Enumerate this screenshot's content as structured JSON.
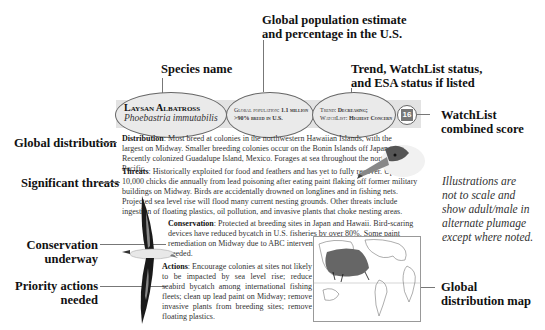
{
  "callouts": {
    "species_name": "Species name",
    "global_population_line1": "Global population estimate",
    "global_population_line2": "and percentage in the U.S.",
    "trend_line1": "Trend, WatchList status,",
    "trend_line2": "and ESA status if listed",
    "watchlist_score_line1": "WatchList",
    "watchlist_score_line2": "combined score",
    "global_distribution": "Global distribution",
    "significant_threats": "Significant threats",
    "conservation_line1": "Conservation",
    "conservation_line2": "underway",
    "priority_line1": "Priority actions",
    "priority_line2": "needed",
    "map_line1": "Global",
    "map_line2": "distribution map"
  },
  "header": {
    "common_name": "Laysan Albatross",
    "scientific_name": "Phoebastria immutabilis",
    "population_label": "Global population:",
    "population_value": "1.1 million",
    "us_percent": ">90% breed in U.S.",
    "trend_label": "Trend:",
    "trend_value": "Decreasing;",
    "watchlist_label": "WatchList:",
    "watchlist_value": "Highest Concern",
    "score": "16"
  },
  "sections": {
    "distribution_label": "Distribution",
    "distribution_text": ": Most breed at colonies in the northwestern Hawaiian Islands, with the largest on Midway. Smaller breeding colonies occur on the Bonin Islands off Japan. Recently colonized Guadalupe Island, Mexico. Forages at sea throughout the northern Pacific.",
    "threats_label": "Threats",
    "threats_text": ": Historically exploited for food and feathers and has yet to fully recover. Up to 10,000 chicks die annually from lead poisoning after eating paint flaking off former military buildings on Midway. Birds are accidentally drowned on longlines and in fishing nets. Projected sea level rise will flood many current nesting grounds. Other threats include ingestion of floating plastics, oil pollution, and invasive plants that choke nesting areas.",
    "conservation_label": "Conservation",
    "conservation_text": ": Protected at breeding sites in Japan and Hawaii. Bird-scaring devices have reduced bycatch in U.S. fisheries by over 80%. Some paint remediation on Midway due to ABC intervention, but significantly more is needed.",
    "actions_label": "Actions",
    "actions_text": ": Encourage colonies at sites not likely to be impacted by sea level rise; reduce seabird bycatch among international fishing fleets; clean up lead paint on Midway; remove invasive plants from breeding sites; remove floating plastics."
  },
  "note": {
    "line1": "Illustrations are",
    "line2": "not to scale and",
    "line3": "show adult/male in",
    "line4": "alternate plumage",
    "line5": "except where noted."
  }
}
